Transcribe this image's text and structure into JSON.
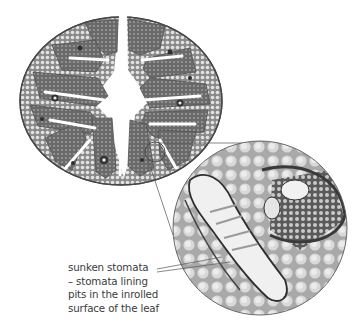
{
  "figure": {
    "leaf_section": {
      "label": "leaf cross-section",
      "shape": "inrolled circular leaf with deep furrows",
      "colors": {
        "tissue": "#6e6e6e",
        "cells": "#bdbdbd",
        "outline": "#4a4a4a",
        "cavity": "#ffffff"
      }
    },
    "inset": {
      "label": "magnified view of sunken stomata region",
      "colors": {
        "background": "#b8b8b8",
        "cells": "#dedede",
        "dark": "#3d3d3d",
        "pit": "#efefef"
      }
    },
    "callout_line_color": "#555555"
  },
  "annotation": {
    "lines": [
      "sunken stomata",
      "– stomata lining",
      "pits in the inrolled",
      "surface of the leaf"
    ]
  }
}
